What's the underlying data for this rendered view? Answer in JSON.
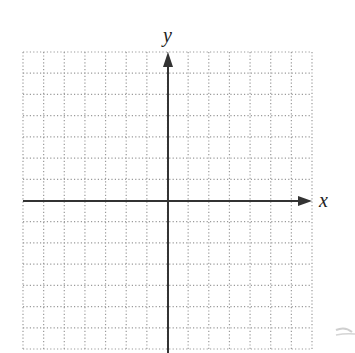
{
  "diagram": {
    "type": "coordinate-grid",
    "x_axis_label": "x",
    "y_axis_label": "y",
    "grid": {
      "columns": 14,
      "rows": 14,
      "left": 23,
      "top": 52,
      "right": 312,
      "bottom": 349,
      "line_style": "dotted",
      "line_color": "#9a9a9a"
    },
    "axes": {
      "origin_x": 168,
      "origin_y": 201,
      "color": "#333333",
      "x_arrow": "right",
      "y_arrow": "up"
    },
    "colors": {
      "background": "#ffffff",
      "axis": "#333333",
      "grid": "#9a9a9a",
      "label": "#222222"
    }
  }
}
